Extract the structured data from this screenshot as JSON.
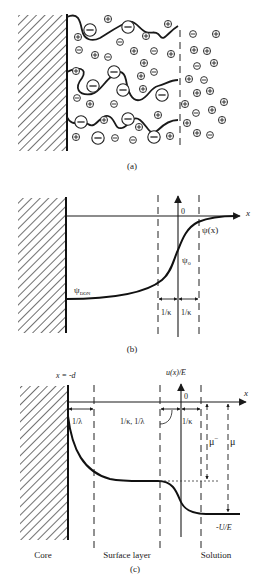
{
  "figure": {
    "top_text_cropped": "",
    "panels": [
      {
        "id": "a",
        "caption": "(a)",
        "description": "Polyelectrolyte brush layer on a core with counter-ions and co-ions",
        "large_ion_symbol": "−",
        "small_plus_symbol": "+",
        "small_minus_symbol": "−"
      },
      {
        "id": "b",
        "caption": "(b)",
        "labels": {
          "x_axis": "x",
          "origin": "0",
          "psi_x": "ψ(x)",
          "psi_0": "ψ",
          "psi_0_sub": "o",
          "psi_don": "ψ",
          "psi_don_sub": "DON",
          "debye_left": "1/κ",
          "debye_right": "1/κ"
        }
      },
      {
        "id": "c",
        "caption": "(c)",
        "labels": {
          "x_minus_d": "x = -d",
          "y_axis": "u(x)/E",
          "x_axis": "x",
          "origin": "0",
          "lambda_left": "1/λ",
          "kappa_lambda": "1/κ, 1/λ",
          "kappa_right": "1/κ",
          "mu_minus": "μ",
          "mu_minus_sup": "−",
          "mu": "μ",
          "minus_u_e": "-U/E",
          "region_core": "Core",
          "region_surface": "Surface layer",
          "region_solution": "Solution"
        }
      }
    ]
  }
}
